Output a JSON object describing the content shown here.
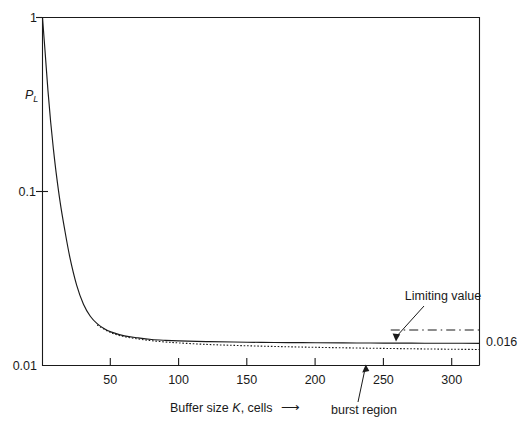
{
  "chart_data": {
    "type": "line",
    "title": "",
    "xlabel": "Buffer size K, cells",
    "ylabel": "P_L",
    "ylabel_main": "P",
    "ylabel_sub": "L",
    "xlabel_prefix": "Buffer size ",
    "xlabel_italic": "K",
    "xlabel_suffix": ", cells",
    "xlabel_arrow": "→",
    "yscale": "log",
    "ylim": [
      0.01,
      1
    ],
    "xlim": [
      0,
      320
    ],
    "grid": false,
    "legend": "none",
    "xticks": [
      50,
      100,
      150,
      200,
      250,
      300
    ],
    "xtick_labels": [
      "50",
      "100",
      "150",
      "200",
      "250",
      "300"
    ],
    "yticks": [
      1,
      0.1,
      0.01
    ],
    "ytick_labels": [
      "1",
      "0.1",
      "0.01"
    ],
    "series": [
      {
        "name": "loss probability (solid)",
        "style": "solid",
        "x": [
          0,
          2,
          4,
          6,
          8,
          10,
          13,
          16,
          20,
          25,
          30,
          35,
          40,
          45,
          50,
          60,
          70,
          80,
          90,
          100,
          120,
          140,
          160,
          180,
          200,
          220,
          240,
          260,
          280,
          300,
          320
        ],
        "y": [
          1.0,
          0.62,
          0.38,
          0.25,
          0.175,
          0.128,
          0.086,
          0.062,
          0.042,
          0.029,
          0.0225,
          0.0192,
          0.0174,
          0.0163,
          0.0156,
          0.0148,
          0.0144,
          0.0141,
          0.01395,
          0.01385,
          0.01372,
          0.01364,
          0.01358,
          0.01354,
          0.01351,
          0.01348,
          0.01346,
          0.01344,
          0.01343,
          0.01342,
          0.01341
        ]
      },
      {
        "name": "burst region approximation (dotted)",
        "style": "dotted",
        "x": [
          40,
          50,
          60,
          70,
          80,
          90,
          100,
          120,
          140,
          160,
          180,
          200,
          220,
          240,
          260,
          280,
          300,
          320
        ],
        "y": [
          0.0171,
          0.01545,
          0.01465,
          0.0142,
          0.01388,
          0.01365,
          0.01348,
          0.01322,
          0.01305,
          0.01292,
          0.01281,
          0.01272,
          0.01264,
          0.01257,
          0.01251,
          0.01245,
          0.0124,
          0.01236
        ]
      },
      {
        "name": "Limiting value (dash-dot)",
        "style": "dashdot",
        "value": 0.016,
        "x": [
          255,
          320
        ],
        "y": [
          0.016,
          0.016
        ]
      }
    ],
    "annotations": [
      {
        "name": "limiting-value",
        "text": "Limiting value",
        "points_to": 0.016
      },
      {
        "name": "burst-region",
        "text": "burst region",
        "points_to": 280
      },
      {
        "name": "limiting-value-number",
        "text": "0.016"
      }
    ]
  },
  "labels": {
    "y_top": "1",
    "y_mid": "0.1",
    "y_bottom": "0.01",
    "y_axis_main": "P",
    "y_axis_sub": "L",
    "x_50": "50",
    "x_100": "100",
    "x_150": "150",
    "x_200": "200",
    "x_250": "250",
    "x_300": "300",
    "x_title_prefix": "Buffer size ",
    "x_title_italic": "K",
    "x_title_suffix": ", cells",
    "x_title_arrow": "⟶",
    "limiting_value_text": "Limiting value",
    "limiting_value_number": "0.016",
    "burst_region_text": "burst region"
  },
  "colors": {
    "ink": "#1a1a1a",
    "background": "#ffffff"
  }
}
